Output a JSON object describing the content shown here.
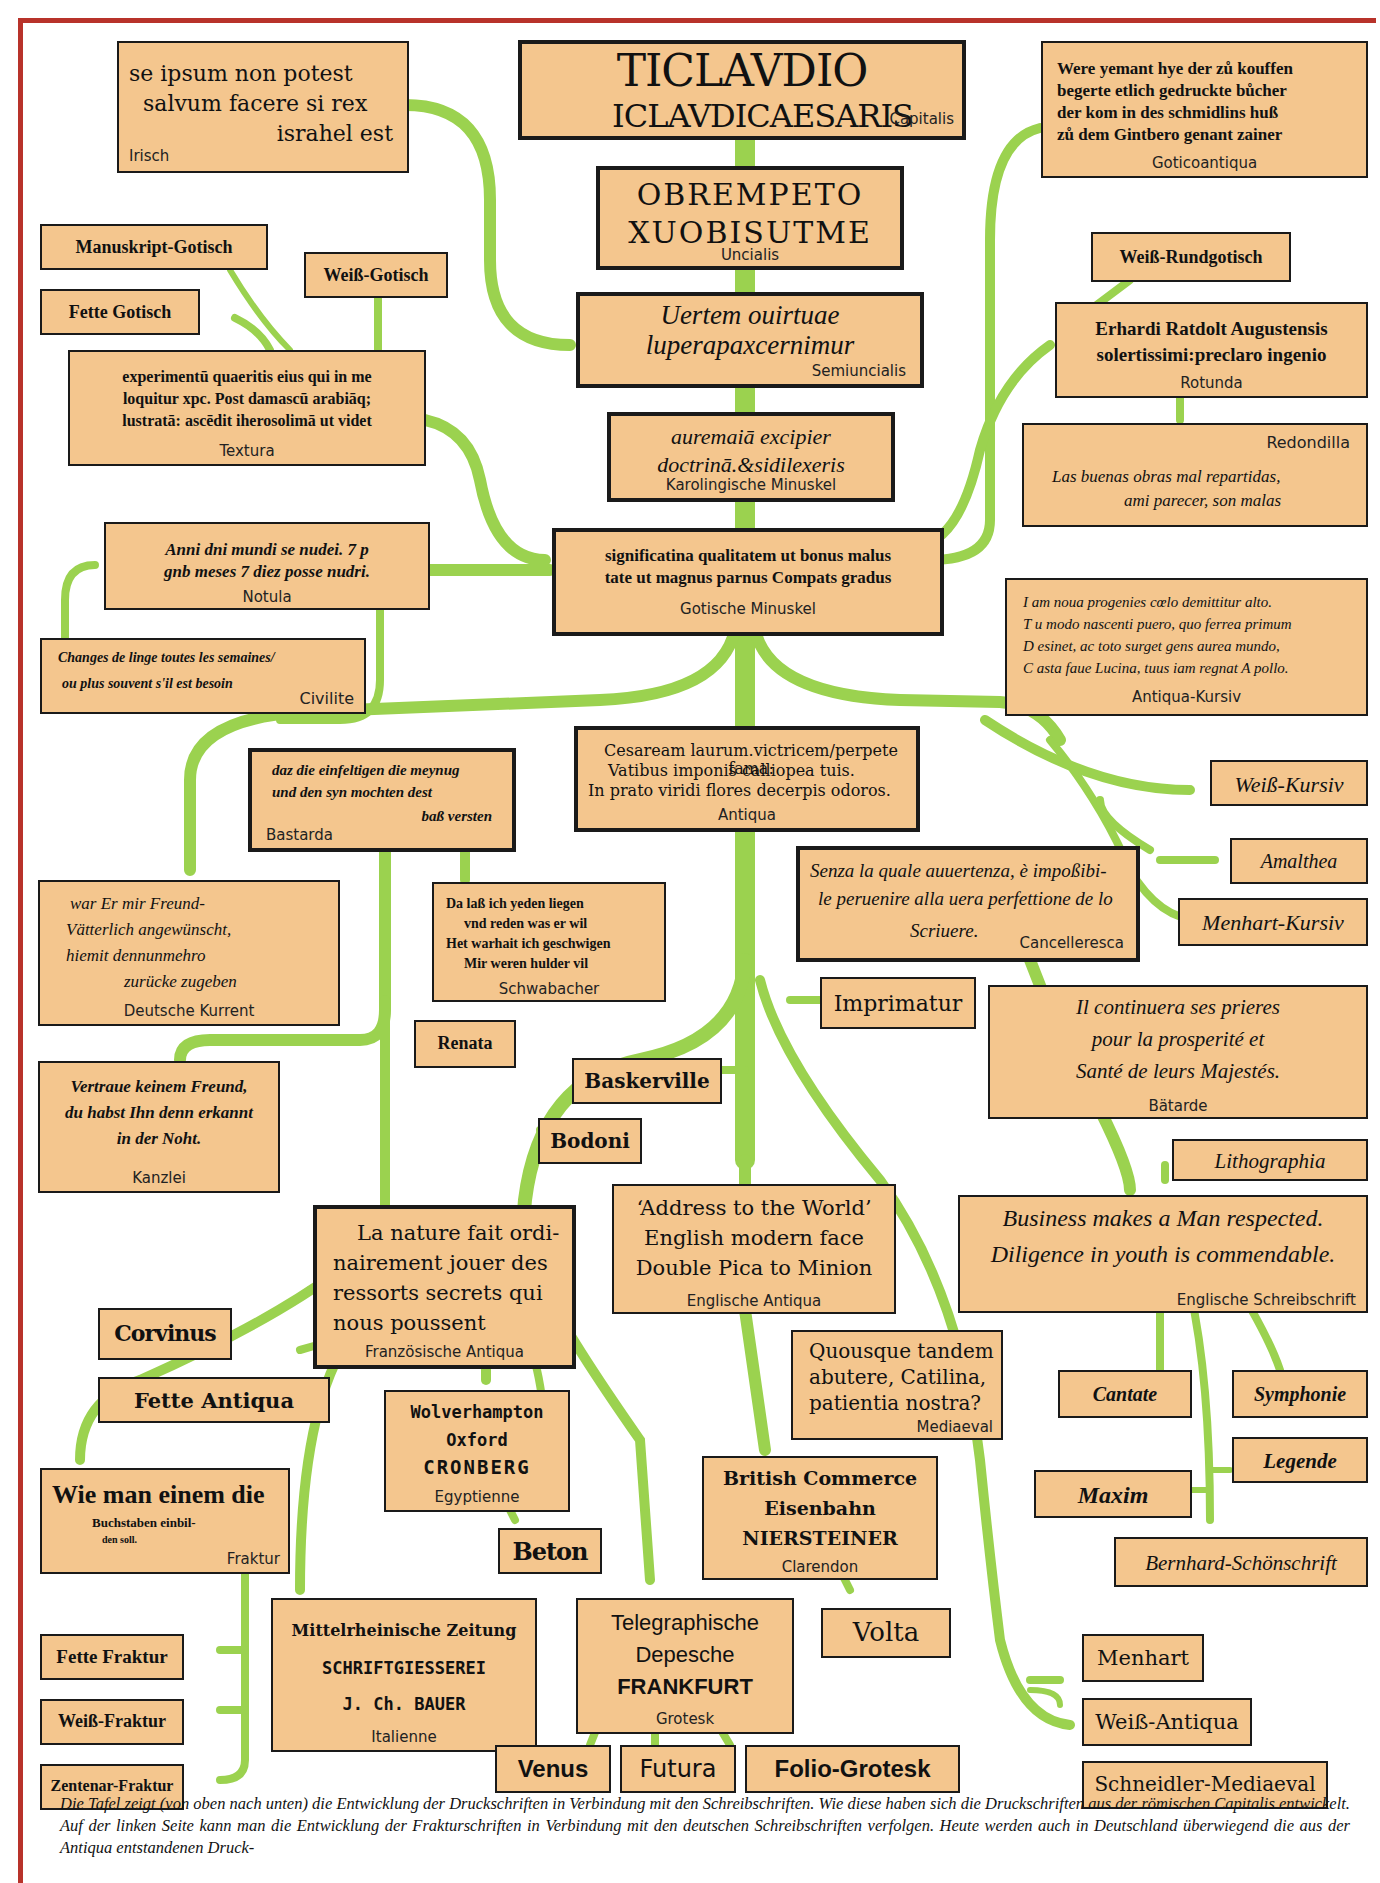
{
  "colors": {
    "frame": "#b8322a",
    "box_fill": "#f4c68e",
    "branch": "#9bd24f",
    "border": "#1a1a1a"
  },
  "nodes": {
    "capitalis": {
      "sample": [
        "TICLAVDIO",
        "ICLAVDICAESARIS"
      ],
      "label": "Capitalis"
    },
    "uncialis": {
      "sample": [
        "OBREMPETO",
        "XUOBISUTME"
      ],
      "label": "Uncialis"
    },
    "semiuncialis": {
      "sample": [
        "Uertem ouirtuae",
        "luperapaxcernimur"
      ],
      "label": "Semiuncialis"
    },
    "karolingische": {
      "sample": [
        "auremaiā excipier",
        "doctrinā.&sidilexeris"
      ],
      "label": "Karolingische Minuskel"
    },
    "gotische_minuskel": {
      "sample": [
        "significatina qualitatem ut bonus malus",
        "tate ut magnus parnus Compats gradus"
      ],
      "label": "Gotische Minuskel"
    },
    "antiqua": {
      "sample": [
        "Cesaream laurum.victricem/perpete fama:",
        "Vatibus imponis calliopea tuis.",
        "In prato viridi flores decerpis odoros."
      ],
      "label": "Antiqua"
    },
    "irisch": {
      "sample": [
        "se ipsum non potest",
        "salvum facere si rex",
        "israhel est"
      ],
      "label": "Irisch"
    },
    "goticoantiqua": {
      "sample": [
        "Were yemant hye der zů kouffen",
        "begerte etlich gedruckte bůcher",
        "der kom in des schmidlins huß",
        "zů dem Gintbero genant zainer"
      ],
      "label": "Goticoantiqua"
    },
    "manuskript_gotisch": {
      "label": "Manuskript-Gotisch"
    },
    "weiss_gotisch": {
      "label": "Weiß-Gotisch"
    },
    "fette_gotisch": {
      "label": "Fette Gotisch"
    },
    "textura": {
      "sample": [
        "experimentū quaeritis eius qui in me",
        "loquitur xpc. Post damascū arabiāq;",
        "lustratā: ascēdit iherosolimā ut videt"
      ],
      "label": "Textura"
    },
    "weiss_rundgotisch": {
      "label": "Weiß-Rundgotisch"
    },
    "rotunda": {
      "sample": [
        "Erhardi Ratdolt Augustensis",
        "solertissimi:preclaro ingenio"
      ],
      "label": "Rotunda"
    },
    "redondilla": {
      "sample": [
        "Las buenas obras mal repartidas,",
        "ami parecer, son malas"
      ],
      "label": "Redondilla"
    },
    "notula": {
      "sample": [
        "Anni dni mundi se nudei. 7 p",
        "gnb meses 7 diez posse nudri."
      ],
      "label": "Notula"
    },
    "civilite": {
      "sample": [
        "Changes de linge toutes les semaines/",
        "ou plus souvent s'il est besoin"
      ],
      "label": "Civilite"
    },
    "antiqua_kursiv": {
      "sample": [
        "I am noua progenies cœlo demittitur alto.",
        "T u modo nascenti puero, quo ferrea primum",
        "D esinet, ac toto surget gens aurea mundo,",
        "C asta faue Lucina, tuus iam regnat A pollo."
      ],
      "label": "Antiqua-Kursiv"
    },
    "bastarda": {
      "sample": [
        "daz die einfeltigen die meynug",
        "und den syn mochten dest",
        "baß versten"
      ],
      "label": "Bastarda"
    },
    "weiss_kursiv": {
      "label": "Weiß-Kursiv"
    },
    "amalthea": {
      "label": "Amalthea"
    },
    "menhart_kursiv": {
      "label": "Menhart-Kursiv"
    },
    "cancelleresca": {
      "sample": [
        "Senza la quale auuertenza, è impoßibi-",
        "le peruenire alla uera perfettione de lo",
        "Scriuere."
      ],
      "label": "Cancelleresca"
    },
    "deutsche_kurrent": {
      "sample": [
        "war Er mir Freund-",
        "Vätterlich angewünscht,",
        "hiemit dennunmehro",
        "zurücke zugeben"
      ],
      "label": "Deutsche Kurrent"
    },
    "schwabacher": {
      "sample": [
        "Da laß ich yeden liegen",
        "vnd reden was er wil",
        "Het warhait ich geschwigen",
        "Mir weren hulder vil"
      ],
      "label": "Schwabacher"
    },
    "renata": {
      "label": "Renata"
    },
    "imprimatur": {
      "label": "Imprimatur"
    },
    "batarde": {
      "sample": [
        "Il continuera ses prieres",
        "pour la prosperité et",
        "Santé de leurs Majestés."
      ],
      "label": "Bätarde"
    },
    "kanzlei": {
      "sample": [
        "Vertraue keinem Freund,",
        "du habst Ihn denn erkannt",
        "in der Noht."
      ],
      "label": "Kanzlei"
    },
    "baskerville": {
      "label": "Baskerville"
    },
    "bodoni": {
      "label": "Bodoni"
    },
    "lithographia": {
      "label": "Lithographia"
    },
    "englische_antiqua": {
      "sample": [
        "‘Address to the World’",
        "English modern face",
        "Double Pica to Minion"
      ],
      "label": "Englische Antiqua"
    },
    "englische_schreibschrift": {
      "sample": [
        "Business makes a Man respected.",
        "Diligence in youth is commendable."
      ],
      "label": "Englische Schreibschrift"
    },
    "franzoesische_antiqua": {
      "sample": [
        "La nature fait ordi-",
        "nairement jouer des",
        "ressorts secrets qui",
        "nous poussent"
      ],
      "label": "Französische Antiqua"
    },
    "corvinus": {
      "label": "Corvinus"
    },
    "fette_antiqua": {
      "label": "Fette Antiqua"
    },
    "mediaeval": {
      "sample": [
        "Quousque tandem",
        "abutere, Catilina,",
        "patientia nostra?"
      ],
      "label": "Mediaeval"
    },
    "cantate": {
      "label": "Cantate"
    },
    "symphonie": {
      "label": "Symphonie"
    },
    "legende": {
      "label": "Legende"
    },
    "maxim": {
      "label": "Maxim"
    },
    "egyptienne": {
      "sample": [
        "Wolverhampton",
        "Oxford",
        "CRONBERG"
      ],
      "label": "Egyptienne"
    },
    "clarendon": {
      "sample": [
        "British Commerce",
        "Eisenbahn",
        "NIERSTEINER"
      ],
      "label": "Clarendon"
    },
    "fraktur": {
      "sample": [
        "Wie man einem die",
        "Buchstaben einbil-",
        "den soll."
      ],
      "label": "Fraktur"
    },
    "beton": {
      "label": "Beton"
    },
    "bernhard_schoenschrift": {
      "label": "Bernhard-Schönschrift"
    },
    "italienne": {
      "sample": [
        "Mittelrheinische Zeitung",
        "SCHRIFTGIESSEREI",
        "J. Ch. BAUER"
      ],
      "label": "Italienne"
    },
    "grotesk": {
      "sample": [
        "Telegraphische",
        "Depesche",
        "FRANKFURT"
      ],
      "label": "Grotesk"
    },
    "volta": {
      "label": "Volta"
    },
    "menhart": {
      "label": "Menhart"
    },
    "weiss_antiqua": {
      "label": "Weiß-Antiqua"
    },
    "schneidler_mediaeval": {
      "label": "Schneidler-Mediaeval"
    },
    "fette_fraktur": {
      "label": "Fette Fraktur"
    },
    "weiss_fraktur": {
      "label": "Weiß-Fraktur"
    },
    "zentenar_fraktur": {
      "label": "Zentenar-Fraktur"
    },
    "venus": {
      "label": "Venus"
    },
    "futura": {
      "label": "Futura"
    },
    "folio_grotesk": {
      "label": "Folio-Grotesk"
    }
  },
  "caption": "Die Tafel zeigt (von oben nach unten) die Entwicklung der Druckschriften in Verbindung mit den Schreibschriften. Wie diese haben sich die Druckschriften aus der römischen Capitalis entwickelt. Auf der linken Seite kann man die Entwicklung der Frakturschriften in Verbindung mit den deutschen Schreibschriften verfolgen. Heute werden auch in Deutschland überwiegend die aus der Antiqua entstandenen Druck-"
}
